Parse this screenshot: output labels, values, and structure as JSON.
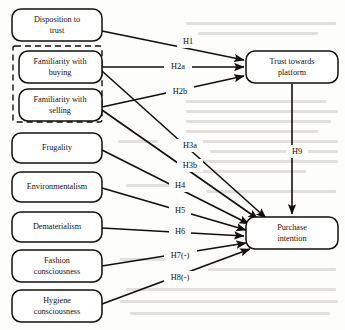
{
  "diagram": {
    "type": "path-model",
    "background_note": "faint bleed-through text from reverse page",
    "colors": {
      "stroke": "#120f0c",
      "node_fill": "#ffffff",
      "page": "#fdfdfc"
    },
    "nodes": [
      {
        "id": "disposition",
        "label_line1": "Disposition to",
        "label_line2": "trust",
        "x": 57,
        "y": 25,
        "w": 90,
        "h": 32
      },
      {
        "id": "fam_buying",
        "label_line1": "Familiarity with",
        "label_line2": "buying",
        "x": 57,
        "y": 67,
        "w": 90,
        "h": 32
      },
      {
        "id": "fam_selling",
        "label_line1": "Familiarity with",
        "label_line2": "selling",
        "x": 57,
        "y": 105,
        "w": 90,
        "h": 32
      },
      {
        "id": "frugality",
        "label_line1": "Frugality",
        "label_line2": "",
        "x": 57,
        "y": 147,
        "w": 90,
        "h": 30
      },
      {
        "id": "environmentalism",
        "label_line1": "Environmentalism",
        "label_line2": "",
        "x": 57,
        "y": 186,
        "w": 90,
        "h": 30
      },
      {
        "id": "dematerialism",
        "label_line1": "Dematerialism",
        "label_line2": "",
        "x": 57,
        "y": 226,
        "w": 90,
        "h": 30
      },
      {
        "id": "fashion",
        "label_line1": "Fashion",
        "label_line2": "consciousness",
        "x": 57,
        "y": 265,
        "w": 90,
        "h": 32
      },
      {
        "id": "hygiene",
        "label_line1": "Hygiene",
        "label_line2": "consciousness",
        "x": 57,
        "y": 306,
        "w": 90,
        "h": 32
      },
      {
        "id": "trust",
        "label_line1": "Trust towards",
        "label_line2": "platform",
        "x": 292,
        "y": 67,
        "w": 92,
        "h": 32
      },
      {
        "id": "purchase",
        "label_line1": "Purchase",
        "label_line2": "intention",
        "x": 292,
        "y": 233,
        "w": 92,
        "h": 32
      }
    ],
    "group_box": {
      "id": "familiarity-group",
      "x": 13,
      "y": 46,
      "w": 89,
      "h": 76,
      "style": "dashed"
    },
    "edges": [
      {
        "id": "h1",
        "label": "H1",
        "from": "disposition",
        "to": "trust",
        "label_x": 188,
        "label_y": 42
      },
      {
        "id": "h2a",
        "label": "H2a",
        "from": "fam_buying",
        "to": "trust",
        "label_x": 178,
        "label_y": 67
      },
      {
        "id": "h2b",
        "label": "H2b",
        "from": "fam_selling",
        "to": "trust",
        "label_x": 180,
        "label_y": 92
      },
      {
        "id": "h3a",
        "label": "H3a",
        "from": "fam_buying",
        "to": "purchase",
        "label_x": 190,
        "label_y": 146
      },
      {
        "id": "h3b",
        "label": "H3b",
        "from": "fam_selling",
        "to": "purchase",
        "label_x": 190,
        "label_y": 166
      },
      {
        "id": "h4",
        "label": "H4",
        "from": "frugality",
        "to": "purchase",
        "label_x": 180,
        "label_y": 186
      },
      {
        "id": "h5",
        "label": "H5",
        "from": "environmentalism",
        "to": "purchase",
        "label_x": 180,
        "label_y": 211
      },
      {
        "id": "h6",
        "label": "H6",
        "from": "dematerialism",
        "to": "purchase",
        "label_x": 180,
        "label_y": 232
      },
      {
        "id": "h7",
        "label": "H7(-)",
        "from": "fashion",
        "to": "purchase",
        "label_x": 180,
        "label_y": 256
      },
      {
        "id": "h8",
        "label": "H8(-)",
        "from": "hygiene",
        "to": "purchase",
        "label_x": 180,
        "label_y": 278
      },
      {
        "id": "h9",
        "label": "H9",
        "from": "trust",
        "to": "purchase",
        "label_x": 297,
        "label_y": 152
      }
    ]
  }
}
